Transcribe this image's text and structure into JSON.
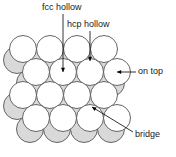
{
  "figure": {
    "type": "diagram",
    "background": "#ffffff"
  },
  "labels": {
    "fcc_hollow": "fcc hollow",
    "hcp_hollow": "hcp hollow",
    "on_top": "on top",
    "bridge": "bridge"
  },
  "colors": {
    "top_layer_fill": "#ffffff",
    "lower_layer_fill": "#d9d9d9",
    "outline": "#555555",
    "leader_line": "#000000",
    "marker": "#000000",
    "text": "#1a1a1a"
  },
  "geometry": {
    "circle_radius": 13.5,
    "row_spacing": 23,
    "col_spacing": 27,
    "lower_layer_offset_x": -6,
    "lower_layer_offset_y": 11
  },
  "atoms": {
    "top_layer_rows": [
      {
        "y": 49,
        "xs": [
          23,
          50,
          77,
          104
        ]
      },
      {
        "y": 72,
        "xs": [
          36,
          63,
          90,
          117
        ]
      },
      {
        "y": 95,
        "xs": [
          23,
          50,
          77,
          104
        ]
      },
      {
        "y": 118,
        "xs": [
          36,
          63,
          90,
          117
        ]
      }
    ],
    "lower_layer_rows": [
      {
        "y": 60,
        "xs": [
          17,
          44,
          71,
          98
        ]
      },
      {
        "y": 83,
        "xs": [
          30,
          57,
          84,
          111
        ]
      },
      {
        "y": 106,
        "xs": [
          17,
          44,
          71,
          98
        ]
      },
      {
        "y": 129,
        "xs": [
          30,
          57,
          84,
          111
        ]
      }
    ]
  },
  "sites": [
    {
      "name": "fcc hollow",
      "marker_x": 63,
      "marker_y": 72,
      "leader_from_x": 63,
      "leader_from_y": 14,
      "label_anchor": "top"
    },
    {
      "name": "hcp hollow",
      "marker_x": 90,
      "marker_y": 61,
      "leader_from_x": 90,
      "leader_from_y": 31,
      "label_anchor": "top"
    },
    {
      "name": "on top",
      "marker_x": 117,
      "marker_y": 72,
      "leader_from_x": 136,
      "leader_from_y": 72,
      "label_anchor": "right"
    },
    {
      "name": "bridge",
      "marker_x": 92,
      "marker_y": 107,
      "leader_from_x": 133,
      "leader_from_y": 132,
      "label_anchor": "right"
    }
  ]
}
